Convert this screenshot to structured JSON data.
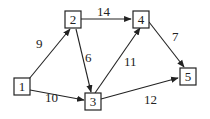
{
  "graph": {
    "directed": true,
    "nodes": [
      {
        "id": "1",
        "label": "1"
      },
      {
        "id": "2",
        "label": "2"
      },
      {
        "id": "3",
        "label": "3"
      },
      {
        "id": "4",
        "label": "4"
      },
      {
        "id": "5",
        "label": "5"
      }
    ],
    "edges": [
      {
        "from": "1",
        "to": "2",
        "weight": "9"
      },
      {
        "from": "1",
        "to": "3",
        "weight": "10"
      },
      {
        "from": "2",
        "to": "4",
        "weight": "14"
      },
      {
        "from": "2",
        "to": "3",
        "weight": "6"
      },
      {
        "from": "3",
        "to": "4",
        "weight": "11"
      },
      {
        "from": "4",
        "to": "5",
        "weight": "7"
      },
      {
        "from": "3",
        "to": "5",
        "weight": "12"
      }
    ]
  }
}
